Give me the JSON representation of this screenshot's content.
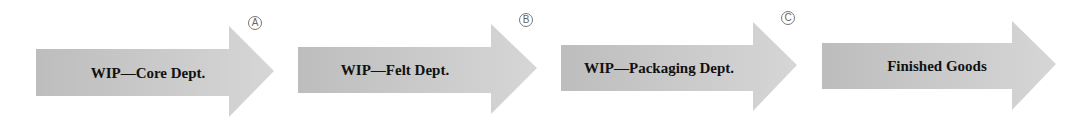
{
  "diagram": {
    "type": "process-flow",
    "fill_color": "#c8c8c8",
    "text_color": "#111111",
    "steps": [
      {
        "label": "WIP—Core Dept.",
        "marker": "A"
      },
      {
        "label": "WIP—Felt Dept.",
        "marker": "B"
      },
      {
        "label": "WIP—Packaging Dept.",
        "marker": "C"
      },
      {
        "label": "Finished Goods",
        "marker": null
      }
    ]
  }
}
